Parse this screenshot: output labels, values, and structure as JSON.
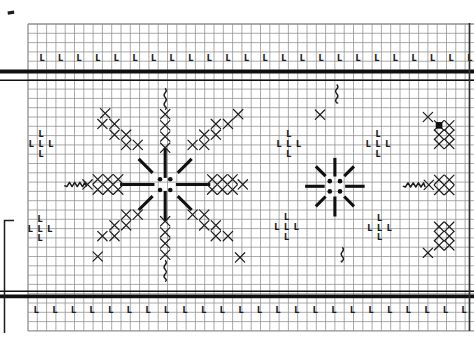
{
  "figure": {
    "kind": "cross-stitch-border-pattern-chart",
    "colors": {
      "background": "#ffffff",
      "grid_line": "#8f8f8f",
      "ink": "#1c1c1c",
      "bold_line": "#101010",
      "edge_artifact": "#2f2f2f"
    },
    "grid": {
      "origin_x": 28,
      "origin_y": 24,
      "cell": 9.3,
      "cols": 48,
      "rows": 33
    },
    "band_rules": {
      "top_thick_y": 71.5,
      "top_medium_y": 80.2,
      "bottom_medium_y": 291.3,
      "bottom_thick_y": 296.3,
      "thick_width": 3.8,
      "medium_width": 1.6,
      "x_start": 0,
      "x_end": 474
    },
    "l_symbol": {
      "glyph": "L",
      "font_size": 8
    },
    "l_border_rows": [
      {
        "name": "top-l-row",
        "gy": 3.65,
        "gx_start": 1.5,
        "step": 2,
        "count": 24
      },
      {
        "name": "bottom-l-row",
        "gy": 30.75,
        "gx_start": 0.9,
        "step": 2,
        "count": 24
      }
    ],
    "l_clusters": {
      "offsets": [
        [
          0,
          -1.05
        ],
        [
          -1.05,
          0
        ],
        [
          0,
          0
        ],
        [
          1.05,
          0
        ],
        [
          0,
          1.05
        ]
      ],
      "centers": [
        [
          1.4,
          12.9
        ],
        [
          28.05,
          12.9
        ],
        [
          37.65,
          12.9
        ],
        [
          1.3,
          22.0
        ],
        [
          27.8,
          21.85
        ],
        [
          37.8,
          21.9
        ]
      ]
    },
    "x_stitches": [
      [
        14.75,
        9.7
      ],
      [
        14.75,
        10.9
      ],
      [
        14.75,
        12.1
      ],
      [
        14.75,
        13.3
      ],
      [
        14.75,
        21.2
      ],
      [
        14.75,
        22.4
      ],
      [
        14.75,
        23.6
      ],
      [
        14.75,
        24.8
      ],
      [
        8.3,
        9.6
      ],
      [
        22.6,
        9.7
      ],
      [
        8.0,
        10.75
      ],
      [
        9.3,
        10.75
      ],
      [
        9.3,
        11.9
      ],
      [
        10.55,
        11.9
      ],
      [
        10.55,
        13.0
      ],
      [
        11.8,
        13.0
      ],
      [
        20.2,
        10.75
      ],
      [
        21.5,
        10.75
      ],
      [
        18.95,
        11.9
      ],
      [
        20.2,
        11.9
      ],
      [
        17.7,
        13.0
      ],
      [
        18.95,
        13.0
      ],
      [
        7.5,
        25.0
      ],
      [
        22.8,
        25.1
      ],
      [
        10.55,
        20.5
      ],
      [
        11.8,
        20.5
      ],
      [
        9.3,
        21.65
      ],
      [
        10.55,
        21.65
      ],
      [
        8.0,
        22.8
      ],
      [
        9.3,
        22.8
      ],
      [
        17.7,
        20.5
      ],
      [
        18.95,
        20.5
      ],
      [
        18.95,
        21.65
      ],
      [
        20.2,
        21.65
      ],
      [
        20.2,
        22.8
      ],
      [
        21.5,
        22.8
      ],
      [
        6.4,
        17.25
      ],
      [
        7.5,
        16.7
      ],
      [
        8.6,
        16.7
      ],
      [
        9.7,
        16.7
      ],
      [
        7.5,
        17.8
      ],
      [
        8.6,
        17.8
      ],
      [
        9.7,
        17.8
      ],
      [
        23.1,
        17.25
      ],
      [
        19.8,
        16.7
      ],
      [
        20.9,
        16.7
      ],
      [
        22.0,
        16.7
      ],
      [
        19.8,
        17.8
      ],
      [
        20.9,
        17.8
      ],
      [
        22.0,
        17.8
      ],
      [
        31.4,
        9.75
      ],
      [
        43.0,
        10.0
      ],
      [
        44.2,
        10.9
      ],
      [
        45.3,
        10.9
      ],
      [
        44.2,
        11.9
      ],
      [
        45.3,
        11.9
      ],
      [
        44.2,
        12.9
      ],
      [
        45.3,
        12.9
      ],
      [
        43.1,
        17.3
      ],
      [
        44.2,
        16.75
      ],
      [
        45.3,
        16.75
      ],
      [
        44.2,
        17.85
      ],
      [
        45.3,
        17.85
      ],
      [
        43.0,
        24.6
      ],
      [
        44.2,
        21.8
      ],
      [
        45.3,
        21.8
      ],
      [
        44.2,
        22.8
      ],
      [
        45.3,
        22.8
      ],
      [
        44.2,
        23.8
      ],
      [
        45.3,
        23.8
      ]
    ],
    "filled_squares": [
      [
        44.2,
        10.9
      ]
    ],
    "center_dots": [
      [
        14.2,
        16.7
      ],
      [
        15.3,
        16.7
      ],
      [
        14.2,
        17.85
      ],
      [
        15.3,
        17.85
      ],
      [
        32.45,
        16.9
      ],
      [
        33.55,
        16.9
      ],
      [
        32.45,
        18.0
      ],
      [
        33.55,
        18.0
      ]
    ],
    "bold_segments": [
      [
        14.75,
        13.3,
        14.75,
        16.55
      ],
      [
        14.75,
        17.95,
        14.75,
        21.2
      ],
      [
        9.9,
        17.25,
        13.6,
        17.25
      ],
      [
        15.9,
        17.25,
        19.6,
        17.25
      ],
      [
        11.9,
        14.5,
        13.4,
        16.0
      ],
      [
        17.6,
        14.5,
        16.1,
        16.0
      ],
      [
        11.9,
        20.0,
        13.4,
        18.5
      ],
      [
        17.6,
        20.0,
        16.1,
        18.5
      ],
      [
        33.0,
        14.4,
        33.0,
        16.4
      ],
      [
        33.0,
        18.55,
        33.0,
        20.7
      ],
      [
        29.8,
        17.45,
        31.9,
        17.45
      ],
      [
        34.1,
        17.45,
        36.2,
        17.45
      ],
      [
        30.95,
        15.3,
        32.0,
        16.35
      ],
      [
        35.05,
        15.3,
        34.0,
        16.35
      ],
      [
        30.95,
        19.6,
        32.0,
        18.55
      ],
      [
        35.05,
        19.6,
        34.0,
        18.55
      ]
    ],
    "vertical_squiggles": [
      [
        14.75,
        6.9,
        9.2
      ],
      [
        14.75,
        25.4,
        27.7
      ],
      [
        33.2,
        6.5,
        8.5
      ],
      [
        33.8,
        24.0,
        25.6
      ]
    ],
    "horizontal_zigzags": [
      [
        17.25,
        3.9,
        6.3
      ],
      [
        17.3,
        40.3,
        42.7
      ]
    ],
    "page_marks": {
      "left_box_border": {
        "tick_x_end": 14,
        "x": 4.5,
        "y_top": 220.5,
        "y_bottom": 333
      },
      "top_left_dash": {
        "x": 7.5,
        "y": 11.5,
        "w": 6.5,
        "h": 3.2
      },
      "right_edge_line": {
        "x": 469.5,
        "y_top": 23,
        "y_bottom": 331
      }
    }
  }
}
